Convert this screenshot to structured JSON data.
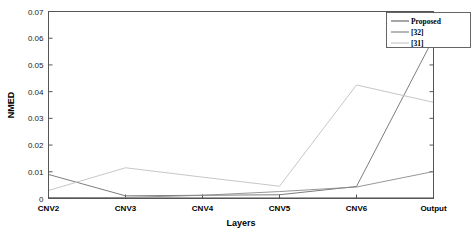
{
  "chart_data": {
    "type": "line",
    "title": "",
    "xlabel": "Layers",
    "ylabel": "NMED",
    "categories": [
      "CNV2",
      "CNV3",
      "CNV4",
      "CNV5",
      "CNV6",
      "Output"
    ],
    "ylim": [
      0,
      0.07
    ],
    "yticks": [
      0,
      0.01,
      0.02,
      0.03,
      0.04,
      0.05,
      0.06,
      0.07
    ],
    "ytick_labels": [
      "0",
      "0.01",
      "0.02",
      "0.03",
      "0.04",
      "0.05",
      "0.06",
      "0.07"
    ],
    "grid": false,
    "legend_position": "top-right",
    "series": [
      {
        "name": "Proposed",
        "color": "#4d4d4d",
        "values": [
          0.0003,
          0.0002,
          0.0002,
          0.0002,
          0.0002,
          0.0002
        ]
      },
      {
        "name": "[32]",
        "color": "#6e6e6e",
        "values": [
          0.009,
          0.001,
          0.0012,
          0.0014,
          0.0045,
          0.06
        ]
      },
      {
        "name": "[31]",
        "color": "#bfbfbf",
        "values": [
          0.003,
          0.0115,
          0.008,
          0.0046,
          0.0425,
          0.036
        ]
      },
      {
        "name": "",
        "color": "#8a8a8a",
        "values": [
          0.0003,
          0.0004,
          0.0012,
          0.0026,
          0.0043,
          0.0101
        ]
      }
    ]
  },
  "legend": {
    "entries": [
      {
        "label": "Proposed"
      },
      {
        "label": "[32]"
      },
      {
        "label": "[31]"
      }
    ]
  },
  "colors": {
    "axis": "#555555",
    "background": "#ffffff",
    "text": "#000000"
  }
}
